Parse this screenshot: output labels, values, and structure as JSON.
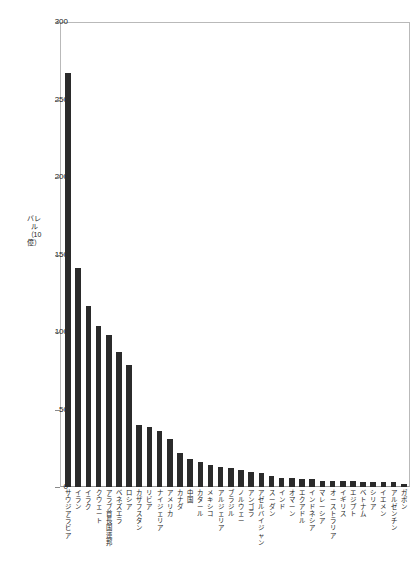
{
  "chart_data": {
    "type": "bar",
    "title": "",
    "xlabel": "",
    "ylabel": "バレル（10億）",
    "ylim": [
      0,
      300
    ],
    "ytick_labels": [
      "300",
      "250",
      "200",
      "150",
      "100",
      "50",
      "0"
    ],
    "yticks": [
      300,
      250,
      200,
      150,
      100,
      50,
      0
    ],
    "grid": false,
    "legend": false,
    "bar_color": "#2b2b2b",
    "categories": [
      "サウジアラビア",
      "イラン",
      "イラク",
      "クウェート",
      "アラブ首長国連邦",
      "ベネズエラ",
      "ロシア",
      "カザフスタン",
      "リビア",
      "ナイジェリア",
      "アメリカ",
      "カナダ",
      "中国",
      "カタール",
      "メキシコ",
      "アルジェリア",
      "ブラジル",
      "ノルウェー",
      "アンゴラ",
      "アゼルバイジャン",
      "スーダン",
      "インド",
      "オマーン",
      "エクアドル",
      "インドネシア",
      "マレーシア",
      "オーストラリア",
      "イギリス",
      "エジプト",
      "ベトナム",
      "シリア",
      "イエメン",
      "アルゼンチン",
      "ガボン"
    ],
    "values": [
      267,
      141,
      117,
      104,
      98,
      87,
      79,
      40,
      39,
      36,
      31,
      22,
      18,
      16,
      14,
      13,
      12,
      11,
      10,
      9,
      7,
      6,
      6,
      5,
      5,
      4,
      4,
      4,
      4,
      3,
      3,
      3,
      3,
      2
    ]
  }
}
